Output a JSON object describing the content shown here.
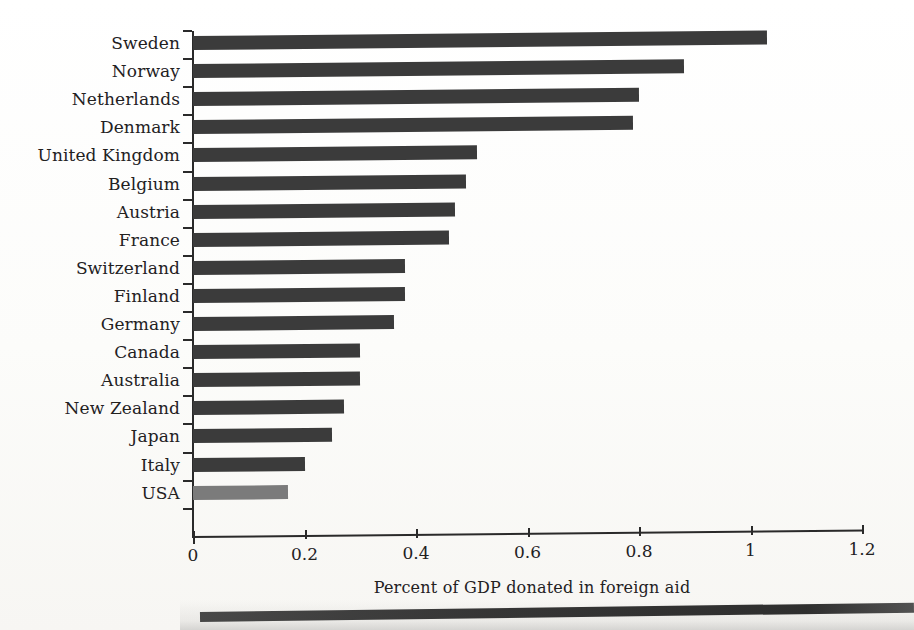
{
  "chart_data": {
    "type": "bar",
    "orientation": "horizontal",
    "title": "",
    "xlabel": "Percent of GDP donated in foreign aid",
    "ylabel": "",
    "xlim": [
      0,
      1.2
    ],
    "xticks": [
      "0",
      "0.2",
      "0.4",
      "0.6",
      "0.8",
      "1",
      "1.2"
    ],
    "xtick_values": [
      0,
      0.2,
      0.4,
      0.6,
      0.8,
      1,
      1.2
    ],
    "grid": false,
    "legend": "none",
    "categories": [
      "Sweden",
      "Norway",
      "Netherlands",
      "Denmark",
      "United Kingdom",
      "Belgium",
      "Austria",
      "France",
      "Switzerland",
      "Finland",
      "Germany",
      "Canada",
      "Australia",
      "New Zealand",
      "Japan",
      "Italy",
      "USA"
    ],
    "values": [
      1.03,
      0.88,
      0.8,
      0.79,
      0.51,
      0.49,
      0.47,
      0.46,
      0.38,
      0.38,
      0.36,
      0.3,
      0.3,
      0.27,
      0.25,
      0.2,
      0.17
    ],
    "highlight_category": "USA",
    "colors": {
      "bar": "#3b3b3b",
      "bar_highlight": "#7b7b7b",
      "axis": "#2a2a2a",
      "text": "#23211f",
      "background": "#fdfdfb"
    }
  }
}
